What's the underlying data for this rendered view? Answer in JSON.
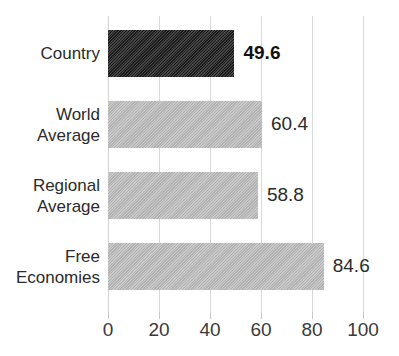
{
  "chart_data": {
    "type": "bar",
    "orientation": "horizontal",
    "title": "",
    "xlabel": "",
    "ylabel": "",
    "xlim": [
      0,
      100
    ],
    "xticks": [
      0,
      20,
      40,
      60,
      80,
      100
    ],
    "xtick_labels": [
      "0",
      "20",
      "40",
      "60",
      "80",
      "100"
    ],
    "grid": true,
    "legend": false,
    "categories": [
      "Country",
      "World Average",
      "Regional Average",
      "Free Economies"
    ],
    "category_lines": [
      [
        "Country"
      ],
      [
        "World",
        "Average"
      ],
      [
        "Regional",
        "Average"
      ],
      [
        "Free",
        "Economies"
      ]
    ],
    "values": [
      49.6,
      60.4,
      58.8,
      84.6
    ],
    "value_labels": [
      "49.6",
      "60.4",
      "58.8",
      "84.6"
    ],
    "bar_colors": [
      "#1f1f1f",
      "#bdbdbd",
      "#bdbdbd",
      "#bdbdbd"
    ],
    "highlighted_index": 0,
    "colors": {
      "highlight_bar": "#1f1f1f",
      "default_bar": "#bdbdbd",
      "gridline": "#d9d9d9",
      "text": "#2b2b2b",
      "background": "#ffffff"
    }
  }
}
